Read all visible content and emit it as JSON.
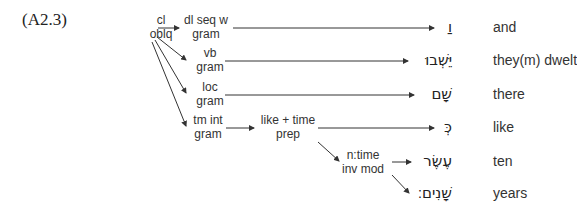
{
  "example_number": "(A2.3)",
  "nodes": {
    "root": {
      "line1": "cl",
      "line2": "oblq"
    },
    "conj": {
      "line1": "dl seq w",
      "line2": "gram"
    },
    "verb": {
      "line1": "vb",
      "line2": "gram"
    },
    "loc": {
      "line1": "loc",
      "line2": "gram"
    },
    "tmint": {
      "line1": "tm int",
      "line2": "gram"
    },
    "prep": {
      "line1": "like + time",
      "line2": "prep"
    },
    "ntime": {
      "line1": "n:time",
      "line2": "inv mod"
    }
  },
  "words": [
    {
      "hebrew": "וַ",
      "gloss": "and"
    },
    {
      "hebrew": "יֵּשְׁבוּ",
      "gloss": "they(m) dwelt"
    },
    {
      "hebrew": "שָׁם",
      "gloss": "there"
    },
    {
      "hebrew": "כְּ",
      "gloss": "like"
    },
    {
      "hebrew": "עֶשֶׂר",
      "gloss": "ten"
    },
    {
      "hebrew": "שָׁנִים׃",
      "gloss": "years"
    }
  ],
  "colors": {
    "line": "#333333",
    "text": "#333333"
  }
}
